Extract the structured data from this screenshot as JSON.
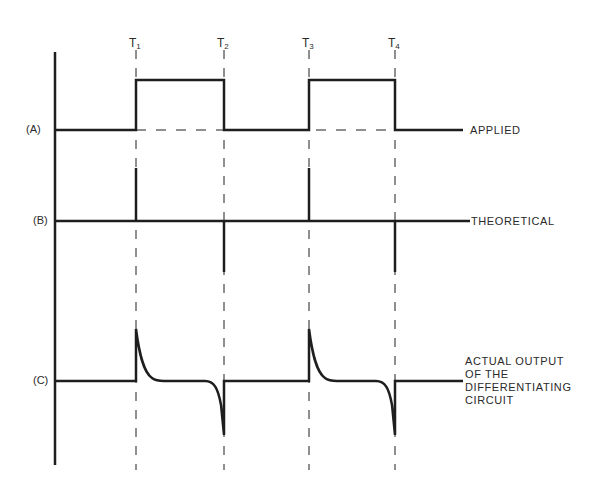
{
  "diagram": {
    "title": "",
    "time_markers": [
      {
        "label": "T",
        "sub": "1",
        "x": 136
      },
      {
        "label": "T",
        "sub": "2",
        "x": 224
      },
      {
        "label": "T",
        "sub": "3",
        "x": 309
      },
      {
        "label": "T",
        "sub": "4",
        "x": 395
      }
    ],
    "rows": [
      {
        "id": "A",
        "row_label": "(A)",
        "description": "APPLIED",
        "baseline_y": 130
      },
      {
        "id": "B",
        "row_label": "(B)",
        "description": "THEORETICAL",
        "baseline_y": 221
      },
      {
        "id": "C",
        "row_label": "(C)",
        "description_lines": [
          "ACTUAL OUTPUT",
          "OF THE",
          "DIFFERENTIATING",
          "CIRCUIT"
        ],
        "baseline_y": 381
      }
    ],
    "colors": {
      "line": "#1e1e1e",
      "text": "#2a2a2a",
      "background": "#ffffff"
    }
  }
}
